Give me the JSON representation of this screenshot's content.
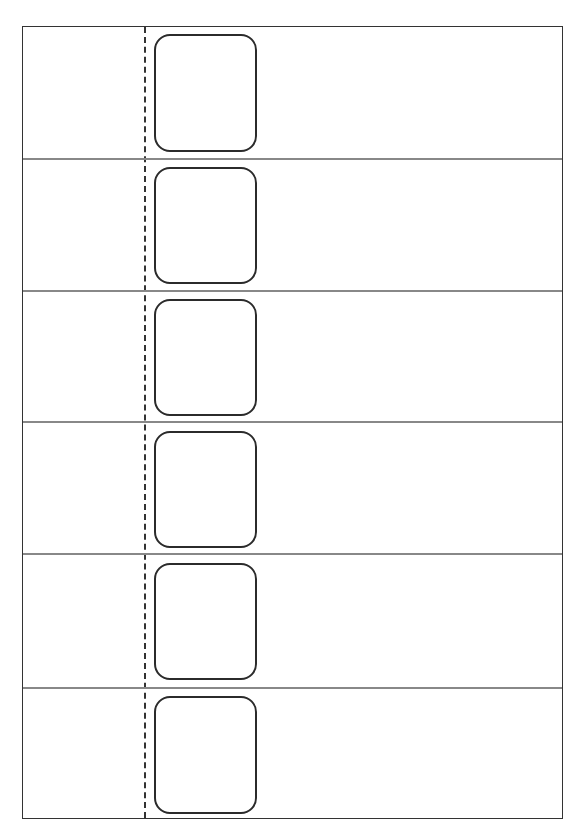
{
  "header": {
    "clipped_text": ""
  },
  "sheet": {
    "row_count": 6,
    "rows": [
      {
        "top": 0,
        "height": 133,
        "card_top": 7,
        "card_height": 118
      },
      {
        "top": 133,
        "height": 132,
        "card_top": 140,
        "card_height": 117
      },
      {
        "top": 265,
        "height": 131,
        "card_top": 272,
        "card_height": 117
      },
      {
        "top": 396,
        "height": 132,
        "card_top": 404,
        "card_height": 117
      },
      {
        "top": 528,
        "height": 134,
        "card_top": 536,
        "card_height": 117
      },
      {
        "top": 662,
        "height": 131,
        "card_top": 669,
        "card_height": 118
      }
    ],
    "colors": {
      "border": "#333333",
      "divider": "#888888",
      "card": "#2b2b2b"
    }
  }
}
